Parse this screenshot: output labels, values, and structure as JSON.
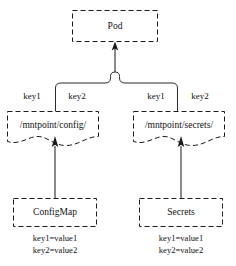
{
  "diagram": {
    "type": "kubernetes-volume-mount-diagram",
    "background_color": "#ffffff",
    "stroke_color": "#1a1a1a",
    "text_color": "#111111"
  },
  "pod": {
    "label": "Pod"
  },
  "mounts": [
    {
      "id": "config-mount",
      "path_label": "/mntpoint/config/",
      "keys": [
        "key1",
        "key2"
      ]
    },
    {
      "id": "secrets-mount",
      "path_label": "/mntpoint/secrets/",
      "keys": [
        "key1",
        "key2"
      ]
    }
  ],
  "sources": [
    {
      "id": "configmap",
      "label": "ConfigMap",
      "entries": [
        "key1=value1",
        "key2=value2"
      ]
    },
    {
      "id": "secrets",
      "label": "Secrets",
      "entries": [
        "key1=value1",
        "key2=value2"
      ]
    }
  ]
}
